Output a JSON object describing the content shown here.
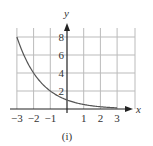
{
  "chart_data": {
    "type": "line",
    "title": "",
    "caption": "(i)",
    "xlabel": "x",
    "ylabel": "y",
    "xlim": [
      -3,
      3
    ],
    "ylim": [
      0,
      8
    ],
    "grid": true,
    "x_ticks": [
      -3,
      -2,
      -1,
      1,
      2,
      3
    ],
    "x_tick_labels": [
      "−3",
      "−2",
      "−1",
      "1",
      "2",
      "3"
    ],
    "y_ticks": [
      2,
      4,
      6,
      8
    ],
    "y_tick_labels": [
      "2",
      "4",
      "6",
      "8"
    ],
    "series": [
      {
        "name": "y = 2^(-x)",
        "x": [
          -3,
          -2,
          -1,
          0,
          1,
          2,
          3
        ],
        "values": [
          8,
          4,
          2,
          1,
          0.5,
          0.25,
          0.125
        ]
      }
    ],
    "colors": {
      "curve": "#555555",
      "grid": "#bbbbbb",
      "axis": "#222222"
    }
  }
}
